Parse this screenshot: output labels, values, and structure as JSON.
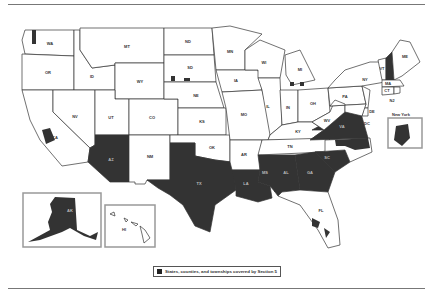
{
  "legend": {
    "label": "States, counties, and townships covered by Section 5",
    "swatch_color": "#222222"
  },
  "colors": {
    "covered": "#333333",
    "not_covered": "#ffffff",
    "border": "#333333",
    "inset_border": "#999999"
  },
  "states": [
    {
      "abbr": "WA",
      "covered": false
    },
    {
      "abbr": "OR",
      "covered": false
    },
    {
      "abbr": "CA",
      "covered": false,
      "partial": true
    },
    {
      "abbr": "ID",
      "covered": false
    },
    {
      "abbr": "NV",
      "covered": false
    },
    {
      "abbr": "MT",
      "covered": false
    },
    {
      "abbr": "WY",
      "covered": false
    },
    {
      "abbr": "UT",
      "covered": false
    },
    {
      "abbr": "AZ",
      "covered": true
    },
    {
      "abbr": "CO",
      "covered": false
    },
    {
      "abbr": "NM",
      "covered": false
    },
    {
      "abbr": "ND",
      "covered": false
    },
    {
      "abbr": "SD",
      "covered": false,
      "partial": true
    },
    {
      "abbr": "NE",
      "covered": false
    },
    {
      "abbr": "KS",
      "covered": false
    },
    {
      "abbr": "OK",
      "covered": false
    },
    {
      "abbr": "TX",
      "covered": true
    },
    {
      "abbr": "MN",
      "covered": false
    },
    {
      "abbr": "IA",
      "covered": false
    },
    {
      "abbr": "MO",
      "covered": false
    },
    {
      "abbr": "AR",
      "covered": false
    },
    {
      "abbr": "LA",
      "covered": true
    },
    {
      "abbr": "WI",
      "covered": false
    },
    {
      "abbr": "IL",
      "covered": false
    },
    {
      "abbr": "MI",
      "covered": false,
      "partial": true
    },
    {
      "abbr": "IN",
      "covered": false
    },
    {
      "abbr": "OH",
      "covered": false
    },
    {
      "abbr": "KY",
      "covered": false
    },
    {
      "abbr": "TN",
      "covered": false
    },
    {
      "abbr": "MS",
      "covered": true
    },
    {
      "abbr": "AL",
      "covered": true
    },
    {
      "abbr": "GA",
      "covered": true
    },
    {
      "abbr": "FL",
      "covered": false,
      "partial": true
    },
    {
      "abbr": "SC",
      "covered": true
    },
    {
      "abbr": "NC",
      "covered": false,
      "partial": true
    },
    {
      "abbr": "VA",
      "covered": true
    },
    {
      "abbr": "WV",
      "covered": false
    },
    {
      "abbr": "PA",
      "covered": false
    },
    {
      "abbr": "NY",
      "covered": false,
      "partial": true
    },
    {
      "abbr": "VT",
      "covered": false
    },
    {
      "abbr": "NH",
      "covered": false,
      "partial": true
    },
    {
      "abbr": "ME",
      "covered": false
    },
    {
      "abbr": "MA",
      "covered": false
    },
    {
      "abbr": "CT",
      "covered": false
    },
    {
      "abbr": "RI",
      "covered": false
    },
    {
      "abbr": "NJ",
      "covered": false
    },
    {
      "abbr": "DE",
      "covered": false
    },
    {
      "abbr": "MD",
      "covered": false
    },
    {
      "abbr": "DC",
      "covered": false
    },
    {
      "abbr": "AK",
      "covered": true
    },
    {
      "abbr": "HI",
      "covered": false
    }
  ],
  "labels": {
    "WA": "WA",
    "OR": "OR",
    "CA": "CA",
    "ID": "ID",
    "NV": "NV",
    "MT": "MT",
    "WY": "WY",
    "UT": "UT",
    "AZ": "AZ",
    "CO": "CO",
    "NM": "NM",
    "ND": "ND",
    "SD": "SD",
    "NE": "NE",
    "KS": "KS",
    "OK": "OK",
    "TX": "TX",
    "MN": "MN",
    "IA": "IA",
    "MO": "MO",
    "AR": "AR",
    "LA": "LA",
    "WI": "WI",
    "IL": "IL",
    "MI": "MI",
    "IN": "IN",
    "OH": "OH",
    "KY": "KY",
    "TN": "TN",
    "MS": "MS",
    "AL": "AL",
    "GA": "GA",
    "FL": "FL",
    "SC": "SC",
    "VA": "VA",
    "WV": "WV",
    "PA": "PA",
    "NY": "NY",
    "VT": "VT",
    "ME": "ME",
    "MA": "MA",
    "CT": "CT",
    "NJ": "NJ",
    "DE": "DE",
    "DC": "DC",
    "AK": "AK",
    "HI": "HI"
  },
  "insets": {
    "alaska": {
      "label": "AK"
    },
    "hawaii": {
      "label": "HI"
    },
    "new_york": {
      "title": "New York"
    }
  }
}
